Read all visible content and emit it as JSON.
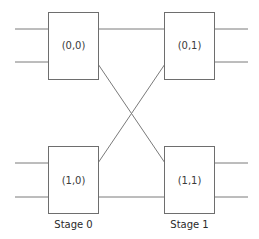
{
  "diagram": {
    "type": "two-stage switching network (butterfly)",
    "switches": [
      {
        "id": "s00",
        "label": "(0,0)",
        "stage": 0,
        "row": 0
      },
      {
        "id": "s01",
        "label": "(0,1)",
        "stage": 1,
        "row": 0
      },
      {
        "id": "s10",
        "label": "(1,0)",
        "stage": 0,
        "row": 1
      },
      {
        "id": "s11",
        "label": "(1,1)",
        "stage": 1,
        "row": 1
      }
    ],
    "stages": [
      {
        "label": "Stage 0"
      },
      {
        "label": "Stage 1"
      }
    ],
    "connections": [
      {
        "from": "(0,0)",
        "to": "(0,1)",
        "kind": "straight"
      },
      {
        "from": "(0,0)",
        "to": "(1,1)",
        "kind": "cross"
      },
      {
        "from": "(1,0)",
        "to": "(0,1)",
        "kind": "cross"
      },
      {
        "from": "(1,0)",
        "to": "(1,1)",
        "kind": "straight"
      }
    ],
    "colors": {
      "stroke": "#6e6e6e",
      "text": "#3a3a3a",
      "background": "#ffffff"
    }
  }
}
